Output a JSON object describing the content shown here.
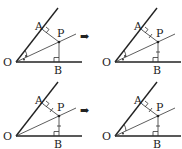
{
  "panels": [
    {
      "id": "top-left",
      "labels": {
        "O": "O",
        "A": "A",
        "P": "P",
        "B": "B"
      },
      "equal_angles": true,
      "equal_segments": false
    },
    {
      "id": "top-right",
      "labels": {
        "O": "O",
        "A": "A",
        "P": "P",
        "B": "B"
      },
      "equal_angles": true,
      "equal_segments": true
    },
    {
      "id": "bottom-left",
      "labels": {
        "O": "O",
        "A": "A",
        "P": "P",
        "B": "B"
      },
      "equal_angles": false,
      "equal_segments": true
    },
    {
      "id": "bottom-right",
      "labels": {
        "O": "O",
        "A": "A",
        "P": "P",
        "B": "B"
      },
      "equal_angles": true,
      "equal_segments": true
    }
  ],
  "arrow_glyph": "➡"
}
